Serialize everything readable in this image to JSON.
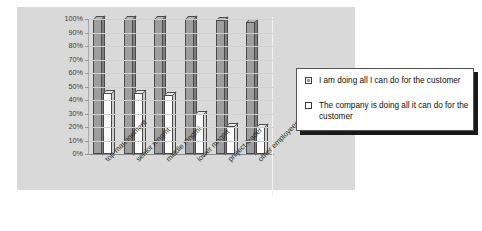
{
  "chart_data": {
    "type": "bar",
    "title": "",
    "subtitle": "",
    "xlabel": "",
    "ylabel": "",
    "ylim": [
      0,
      100
    ],
    "ytick_labels": [
      "100%",
      "90%",
      "80%",
      "70%",
      "60%",
      "50%",
      "40%",
      "30%",
      "20%",
      "10%",
      "0%"
    ],
    "ytick_values": [
      100,
      90,
      80,
      70,
      60,
      50,
      40,
      30,
      20,
      10,
      0
    ],
    "grid": true,
    "legend_position": "right",
    "categories": [
      "top management",
      "senior mngmt",
      "middle mngmt",
      "lower mngmt",
      "project leader",
      "other employees"
    ],
    "series": [
      {
        "name": "I am doing all I can do for the customer",
        "color": "#9e9e9e",
        "values": [
          100,
          100,
          100,
          100,
          99,
          98
        ]
      },
      {
        "name": "The company is doing all it can do for the customer",
        "color": "#ffffff",
        "values": [
          45,
          45,
          44,
          30,
          21,
          20
        ]
      }
    ]
  },
  "legend": {
    "items": [
      {
        "swatch": "filled-gray-swatch",
        "label": "I am doing all I can do for the customer"
      },
      {
        "swatch": "empty-white-swatch",
        "label": "The company is doing all it can do for the customer"
      }
    ]
  }
}
